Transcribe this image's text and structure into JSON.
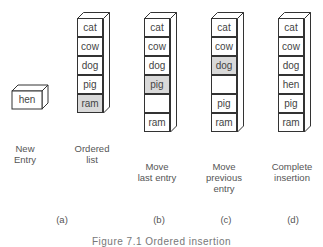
{
  "new_entry": {
    "value": "hen",
    "label_line1": "New",
    "label_line2": "Entry"
  },
  "columns": [
    {
      "id": "a",
      "cells": [
        {
          "text": "cat",
          "shaded": false
        },
        {
          "text": "cow",
          "shaded": false
        },
        {
          "text": "dog",
          "shaded": false
        },
        {
          "text": "pig",
          "shaded": false
        },
        {
          "text": "ram",
          "shaded": true
        }
      ],
      "label_lines": [
        "Ordered",
        "list"
      ]
    },
    {
      "id": "b",
      "cells": [
        {
          "text": "cat",
          "shaded": false
        },
        {
          "text": "cow",
          "shaded": false
        },
        {
          "text": "dog",
          "shaded": false
        },
        {
          "text": "pig",
          "shaded": true
        },
        {
          "text": "",
          "shaded": false
        },
        {
          "text": "ram",
          "shaded": false
        }
      ],
      "label_lines": [
        "Move",
        "last entry"
      ]
    },
    {
      "id": "c",
      "cells": [
        {
          "text": "cat",
          "shaded": false
        },
        {
          "text": "cow",
          "shaded": false
        },
        {
          "text": "dog",
          "shaded": true
        },
        {
          "text": "",
          "shaded": false
        },
        {
          "text": "pig",
          "shaded": false
        },
        {
          "text": "ram",
          "shaded": false
        }
      ],
      "label_lines": [
        "Move",
        "previous",
        "entry"
      ]
    },
    {
      "id": "d",
      "cells": [
        {
          "text": "cat",
          "shaded": false
        },
        {
          "text": "cow",
          "shaded": false
        },
        {
          "text": "dog",
          "shaded": false
        },
        {
          "text": "hen",
          "shaded": false
        },
        {
          "text": "pig",
          "shaded": false
        },
        {
          "text": "ram",
          "shaded": false
        }
      ],
      "label_lines": [
        "Complete",
        "insertion"
      ]
    }
  ],
  "subfigure_labels": [
    "(a)",
    "(b)",
    "(c)",
    "(d)"
  ],
  "caption": "Figure 7.1 Ordered insertion",
  "colors": {
    "shaded_cell": "#d9d9d9",
    "outline": "#333333",
    "text": "#4a4a4a"
  }
}
